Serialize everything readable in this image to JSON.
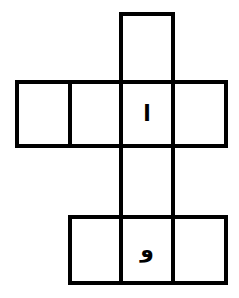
{
  "puzzle": {
    "type": "arabic-crossword-grid",
    "line_color": "#000000",
    "background": "#ffffff",
    "cells": [
      {
        "id": "top",
        "letter": ""
      },
      {
        "id": "row2-col1",
        "letter": ""
      },
      {
        "id": "row2-col2",
        "letter": ""
      },
      {
        "id": "row2-col3",
        "letter": "ا"
      },
      {
        "id": "row2-col4",
        "letter": ""
      },
      {
        "id": "connector",
        "letter": ""
      },
      {
        "id": "row4-col2",
        "letter": ""
      },
      {
        "id": "row4-col3",
        "letter": "و"
      },
      {
        "id": "row4-col4",
        "letter": ""
      }
    ]
  }
}
